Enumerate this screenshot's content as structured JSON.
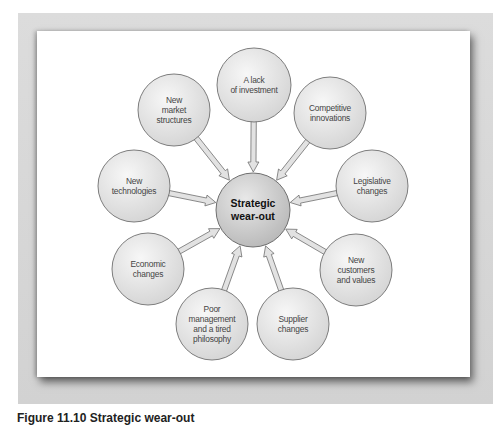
{
  "diagram": {
    "center": {
      "label_line1": "Strategic",
      "label_line2": "wear-out",
      "x": 253,
      "y": 210,
      "r": 37
    },
    "nodes": [
      {
        "id": "lack-of-investment",
        "lines": [
          "A lack",
          "of investment"
        ],
        "x": 254,
        "y": 85,
        "r": 37
      },
      {
        "id": "competitive-innovations",
        "lines": [
          "Competitive",
          "innovations"
        ],
        "x": 330,
        "y": 113,
        "r": 36
      },
      {
        "id": "legislative-changes",
        "lines": [
          "Legislative",
          "changes"
        ],
        "x": 372,
        "y": 186,
        "r": 36
      },
      {
        "id": "new-customers-and-values",
        "lines": [
          "New",
          "customers",
          "and values"
        ],
        "x": 356,
        "y": 270,
        "r": 36
      },
      {
        "id": "supplier-changes",
        "lines": [
          "Supplier",
          "changes"
        ],
        "x": 293,
        "y": 324,
        "r": 36
      },
      {
        "id": "poor-management",
        "lines": [
          "Poor",
          "management",
          "and a tired",
          "philosophy"
        ],
        "x": 212,
        "y": 324,
        "r": 36
      },
      {
        "id": "economic-changes",
        "lines": [
          "Economic",
          "changes"
        ],
        "x": 148,
        "y": 269,
        "r": 36
      },
      {
        "id": "new-technologies",
        "lines": [
          "New",
          "technologies"
        ],
        "x": 134,
        "y": 186,
        "r": 36
      },
      {
        "id": "new-market-structures",
        "lines": [
          "New",
          "market",
          "structures"
        ],
        "x": 174,
        "y": 110,
        "r": 36
      }
    ],
    "colors": {
      "node_fill_light": "#f4f4f4",
      "node_fill_dark": "#d6d6d6",
      "center_fill_light": "#e6e6e6",
      "center_fill_dark": "#bdbdbd",
      "stroke": "#6f6f6f",
      "arrow_fill": "#e2e2e2"
    }
  },
  "caption": {
    "text": "Figure 11.10 Strategic wear-out"
  }
}
